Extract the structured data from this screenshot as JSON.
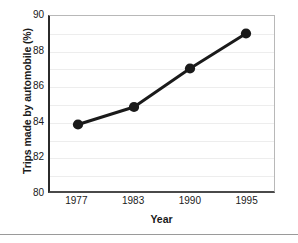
{
  "chart_data": {
    "type": "line",
    "title": "",
    "xlabel": "Year",
    "ylabel": "Trips made by automobile (%)",
    "categories": [
      "1977",
      "1983",
      "1990",
      "1995"
    ],
    "values": [
      83.8,
      84.8,
      87.0,
      89.0
    ],
    "series": [
      {
        "name": "Trips made by automobile",
        "values": [
          83.8,
          84.8,
          87.0,
          89.0
        ]
      }
    ],
    "ylim": [
      80,
      90
    ],
    "yticks": [
      "80",
      "82",
      "84",
      "86",
      "88",
      "90"
    ],
    "ytick_values": [
      80,
      82,
      84,
      86,
      88,
      90
    ],
    "gridline_values": [
      80,
      81,
      82,
      83,
      84,
      85,
      86,
      87,
      88,
      89,
      90
    ],
    "grid": true,
    "legend": "none",
    "line_color": "#1a1a1a",
    "marker_color": "#1a1a1a",
    "grid_color": "#ededed",
    "axis_color": "#2b2b2b",
    "background_color": "#ffffff"
  }
}
